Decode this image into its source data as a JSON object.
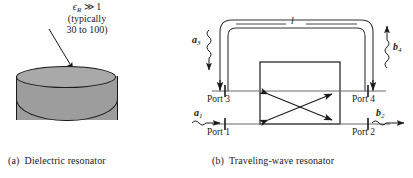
{
  "figure": {
    "panel_a": {
      "caption_letter": "(a)",
      "caption_text": "Dielectric resonator",
      "annotation": {
        "line1_symbol": "ϵ",
        "line1_sub": "R",
        "line1_rel": "≫",
        "line1_value": "1",
        "line2": "(typically",
        "line3": "30 to 100)"
      },
      "object_name": "dielectric-resonator-cylinder",
      "object_fill_color": "#9d9d9d",
      "object_top_color": "#a9a9a9",
      "outline_color": "#1a1a1a"
    },
    "panel_b": {
      "caption_letter": "(b)",
      "caption_text": "Traveling-wave resonator",
      "loop_length_label": "l",
      "ports": [
        {
          "id": "port1",
          "label": "Port 1"
        },
        {
          "id": "port2",
          "label": "Port 2"
        },
        {
          "id": "port3",
          "label": "Port 3"
        },
        {
          "id": "port4",
          "label": "Port 4"
        }
      ],
      "waves": [
        {
          "id": "a1",
          "symbol": "a",
          "sub": "1"
        },
        {
          "id": "b2",
          "symbol": "b",
          "sub": "2"
        },
        {
          "id": "a3",
          "symbol": "a",
          "sub": "3"
        },
        {
          "id": "b4",
          "symbol": "b",
          "sub": "4"
        }
      ],
      "coupler_name": "directional-coupler-box",
      "line_color": "#555555",
      "outline_color": "#1a1a1a"
    }
  }
}
